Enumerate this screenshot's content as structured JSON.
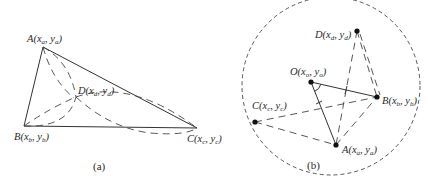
{
  "figure": {
    "panel_a": {
      "caption": "(a)",
      "labels": {
        "A": "A(x",
        "A_sub": "a",
        "A_mid": ", y",
        "A_sub2": "a",
        "A_end": ")",
        "B": "B(x",
        "B_sub": "b",
        "B_mid": ", y",
        "B_sub2": "b",
        "B_end": ")",
        "C": "C(x",
        "C_sub": "c",
        "C_mid": ", y",
        "C_sub2": "c",
        "C_end": ")",
        "D": "D(x",
        "D_sub": "d",
        "D_mid": ", y",
        "D_sub2": "d",
        "D_end": ")"
      },
      "points": {
        "A": [
          43,
          47
        ],
        "B": [
          24,
          126
        ],
        "C": [
          197,
          128
        ],
        "D": [
          76,
          97
        ]
      }
    },
    "panel_b": {
      "caption": "(b)",
      "labels": {
        "O": "O(x",
        "O_sub": "o",
        "O_mid": ", y",
        "O_sub2": "o",
        "O_end": ")",
        "A": "A(x",
        "A_sub": "a",
        "A_mid": ", y",
        "A_sub2": "a",
        "A_end": ")",
        "B": "B(x",
        "B_sub": "b",
        "B_mid": ", y",
        "B_sub2": "b",
        "B_end": ")",
        "C": "C(x",
        "C_sub": "c",
        "C_mid": ", y",
        "C_sub2": "c",
        "C_end": ")",
        "D": "D(x",
        "D_sub": "d",
        "D_mid": ", y",
        "D_sub2": "d",
        "D_end": ")"
      },
      "circle": {
        "cx": 331,
        "cy": 86,
        "r": 89
      },
      "points": {
        "O": [
          311,
          82
        ],
        "A": [
          336,
          145
        ],
        "B": [
          377,
          97
        ],
        "C": [
          255,
          122
        ],
        "D": [
          357,
          31
        ]
      }
    }
  }
}
